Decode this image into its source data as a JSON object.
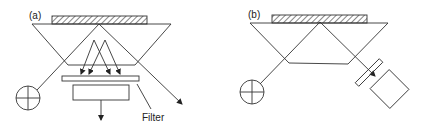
{
  "panels": [
    {
      "id": "a",
      "label": "(a)",
      "components": [
        "sample",
        "prism",
        "light-source",
        "filter",
        "detector"
      ],
      "annotations": {
        "filter_label": "Filter"
      }
    },
    {
      "id": "b",
      "label": "(b)",
      "components": [
        "sample",
        "prism",
        "light-source",
        "filter",
        "detector"
      ]
    }
  ],
  "colors": {
    "stroke": "#333333",
    "background": "#ffffff"
  }
}
